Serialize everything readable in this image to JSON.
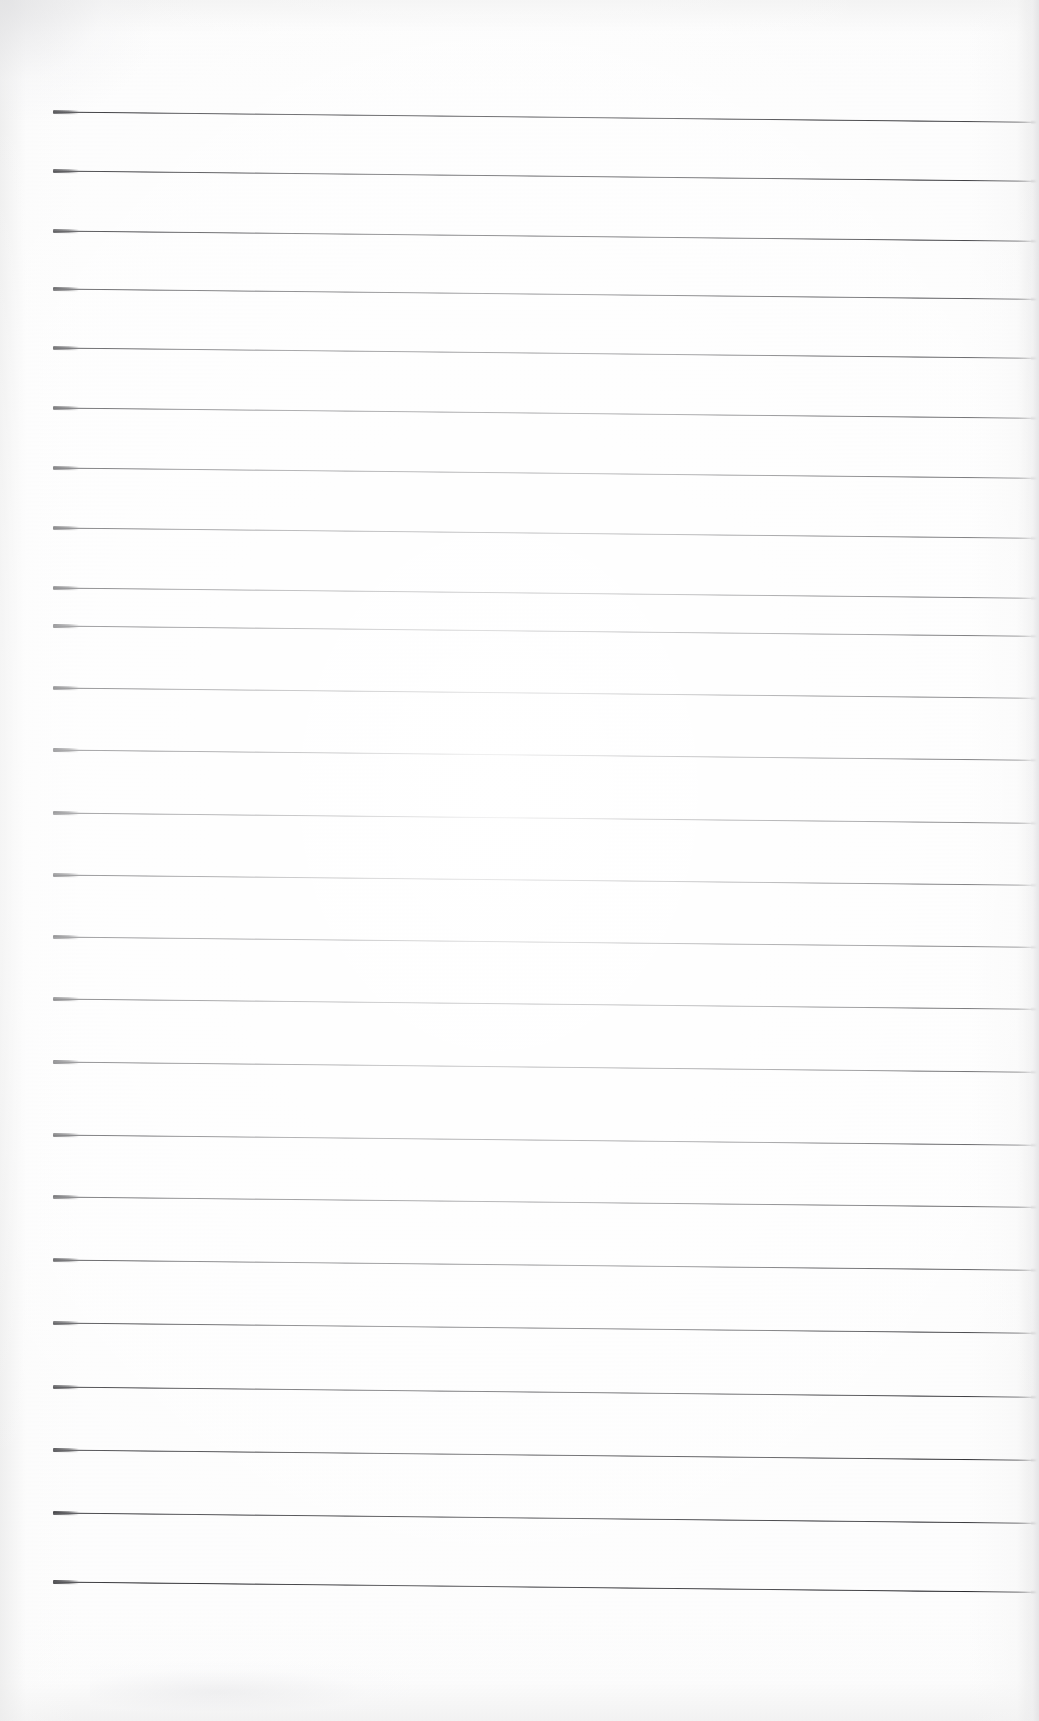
{
  "document": {
    "kind": "scanned-lined-paper",
    "title": "Blank ruled notebook page",
    "text_content": "",
    "handwriting": "",
    "page_width": 1039,
    "page_height": 1721,
    "background_color": "#fdfdfd",
    "rule_color": "#202024",
    "rule_thickness_px": 2,
    "rule_left_x": 53,
    "rule_right_x": 1036,
    "rule_slope_deg": 0.6,
    "rule_count": 24,
    "rule_spacing_px": 61.5,
    "first_rule_y": 112,
    "last_rule_y": 1582,
    "top_margin_px": 112,
    "bottom_margin_px": 139,
    "rules": [
      {
        "index": 1,
        "y": 112
      },
      {
        "index": 2,
        "y": 171
      },
      {
        "index": 3,
        "y": 231
      },
      {
        "index": 4,
        "y": 289
      },
      {
        "index": 5,
        "y": 348
      },
      {
        "index": 6,
        "y": 408
      },
      {
        "index": 7,
        "y": 468
      },
      {
        "index": 8,
        "y": 528
      },
      {
        "index": 9,
        "y": 588
      },
      {
        "index": 10,
        "y": 626
      },
      {
        "index": 11,
        "y": 688
      },
      {
        "index": 12,
        "y": 750
      },
      {
        "index": 13,
        "y": 813
      },
      {
        "index": 14,
        "y": 875
      },
      {
        "index": 15,
        "y": 937
      },
      {
        "index": 16,
        "y": 999
      },
      {
        "index": 17,
        "y": 1062
      },
      {
        "index": 18,
        "y": 1135
      },
      {
        "index": 19,
        "y": 1197
      },
      {
        "index": 20,
        "y": 1260
      },
      {
        "index": 21,
        "y": 1323
      },
      {
        "index": 22,
        "y": 1387
      },
      {
        "index": 23,
        "y": 1450
      },
      {
        "index": 24,
        "y": 1513
      },
      {
        "index": 25,
        "y": 1582
      }
    ]
  }
}
